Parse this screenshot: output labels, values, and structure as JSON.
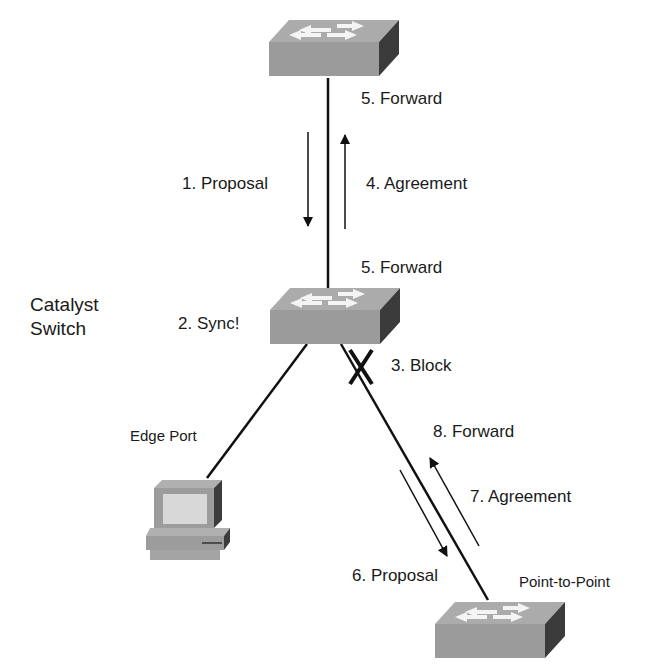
{
  "diagram": {
    "nodes": {
      "top_switch": {
        "type": "switch"
      },
      "catalyst_switch": {
        "type": "switch",
        "label": "Catalyst Switch",
        "label_line1": "Catalyst",
        "label_line2": "Switch"
      },
      "edge_pc": {
        "type": "pc",
        "label": "Edge Port"
      },
      "p2p_switch": {
        "type": "switch",
        "label": "Point-to-Point"
      }
    },
    "links": [
      {
        "from": "top_switch",
        "to": "catalyst_switch"
      },
      {
        "from": "catalyst_switch",
        "to": "edge_pc"
      },
      {
        "from": "catalyst_switch",
        "to": "p2p_switch",
        "blocked_marker": "X"
      }
    ],
    "steps": {
      "s1": "1. Proposal",
      "s2": "2. Sync!",
      "s3": "3. Block",
      "s4": "4. Agreement",
      "s5_top": "5. Forward",
      "s5_bottom": "5. Forward",
      "s6": "6. Proposal",
      "s7": "7. Agreement",
      "s8": "8. Forward"
    },
    "colors": {
      "line": "#111111",
      "device_top": "#a8a8a8",
      "device_front": "#9a9a9a",
      "device_side": "#3c3c3c",
      "arrow_glyph": "#f2f2f2"
    }
  }
}
